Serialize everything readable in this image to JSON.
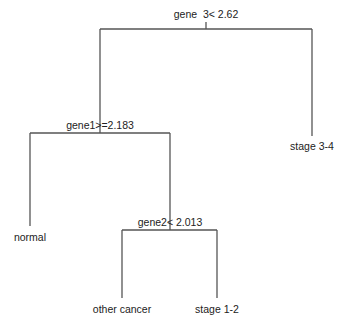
{
  "diagram": {
    "type": "decision-tree",
    "root": {
      "id": "n1",
      "split": "gene  3< 2.62",
      "left": {
        "id": "n2",
        "split": "gene1>=2.183",
        "left": {
          "id": "leaf-normal",
          "label": "normal"
        },
        "right": {
          "id": "n3",
          "split": "gene2< 2.013",
          "left": {
            "id": "leaf-other-cancer",
            "label": "other cancer"
          },
          "right": {
            "id": "leaf-stage-1-2",
            "label": "stage 1-2"
          }
        }
      },
      "right": {
        "id": "leaf-stage-3-4",
        "label": "stage 3-4"
      }
    },
    "labels": {
      "n1": "gene  3< 2.62",
      "n2": "gene1>=2.183",
      "n3": "gene2< 2.013",
      "leaf_normal": "normal",
      "leaf_other_cancer": "other cancer",
      "leaf_stage_1_2": "stage 1-2",
      "leaf_stage_3_4": "stage 3-4"
    },
    "line_color": "#555555",
    "text_color": "#222222"
  }
}
